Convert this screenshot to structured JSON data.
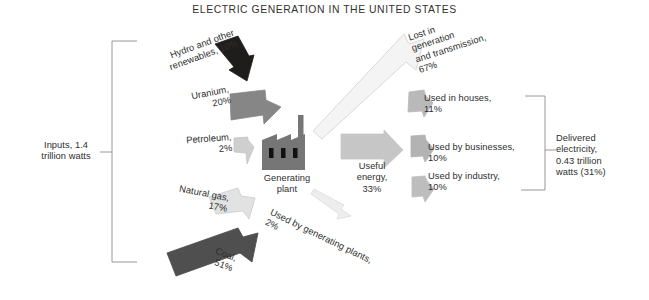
{
  "title": "ELECTRIC GENERATION IN THE UNITED STATES",
  "inputs_bracket_label": "Inputs, 1.4\ntrillion watts",
  "delivered_bracket_label": "Delivered\nelectricity,\n0.43 trillion\nwatts (31%)",
  "plant_label": "Generating\nplant",
  "inputs": [
    {
      "name": "hydro-and-other-renewables",
      "label": "Hydro and other\nrenewables, 10%",
      "percent": 10,
      "color": "#1f1d1c"
    },
    {
      "name": "uranium",
      "label": "Uranium,\n20%",
      "percent": 20,
      "color": "#868686"
    },
    {
      "name": "petroleum",
      "label": "Petroleum,\n2%",
      "percent": 2,
      "color": "#cfcfcf"
    },
    {
      "name": "natural-gas",
      "label": "Natural gas,\n17%",
      "percent": 17,
      "color": "#e2e2e2"
    },
    {
      "name": "coal",
      "label": "Coal,\n51%",
      "percent": 51,
      "color": "#4f4f4f"
    }
  ],
  "losses": [
    {
      "name": "lost-in-generation-and-transmission",
      "label": "Lost in\ngeneration\nand transmission,\n67%",
      "percent": 67,
      "color": "#f4f4f4"
    },
    {
      "name": "used-by-generating-plants",
      "label": "Used by generating plants,\n2%",
      "percent": 2,
      "color": "#ededed"
    }
  ],
  "useful_energy": {
    "name": "useful-energy",
    "label": "Useful\nenergy,\n33%",
    "percent": 33,
    "color": "#c6c6c6"
  },
  "outputs": [
    {
      "name": "used-in-houses",
      "label": "Used in houses,\n11%",
      "percent": 11,
      "color": "#b9b9b9"
    },
    {
      "name": "used-by-businesses",
      "label": "Used by businesses,\n10%",
      "percent": 10,
      "color": "#b3b3b3"
    },
    {
      "name": "used-by-industry",
      "label": "Used by industry,\n10%",
      "percent": 10,
      "color": "#bdbdbd"
    }
  ],
  "colors": {
    "background": "#ffffff",
    "text": "#2e2e2e",
    "bracket_line": "#8d8d8d",
    "plant_body": "#767676",
    "plant_window": "#111111"
  }
}
